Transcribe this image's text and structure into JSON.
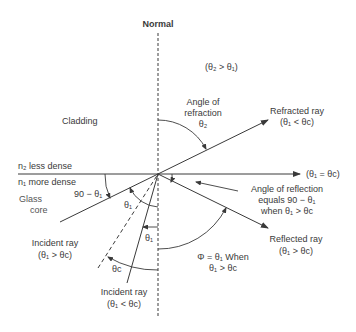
{
  "normal_label": "Normal",
  "condition_top": "(θ₂ > θ₁)",
  "cladding_label": "Cladding",
  "n2_label": "n₂ less dense",
  "n1_label": "n₁ more dense",
  "glass_label": "Glass",
  "core_label": "core",
  "angle_90_label": "90 − θ₁",
  "refraction": {
    "line1": "Angle of",
    "line2": "refraction",
    "symbol": "θ₂"
  },
  "refracted_ray": {
    "title": "Refracted ray",
    "condition": "(θ₁ < θc)"
  },
  "critical_ray_condition": "(θ₁ = θc)",
  "reflection_angle": {
    "line1": "Angle of reflection",
    "line2": "equals 90 − θ₁",
    "line3": "when θ₁ > θc"
  },
  "reflected_ray": {
    "title": "Reflected ray",
    "condition": "(θ₁ > θc)"
  },
  "phi_note": {
    "line1": "Φ = θ₁ When",
    "line2": "θ₁ > θc"
  },
  "incident_ray_large": {
    "title": "Incident ray",
    "condition": "(θ₁ > θc)"
  },
  "incident_ray_small": {
    "title": "Incident ray",
    "condition": "(θ₁ < θc)"
  },
  "theta1_upper": "θ₁",
  "theta1_lower": "θ₁",
  "theta_c": "θc",
  "colors": {
    "line": "#3a3a3a",
    "text": "#3a3a3a",
    "background": "#ffffff"
  }
}
